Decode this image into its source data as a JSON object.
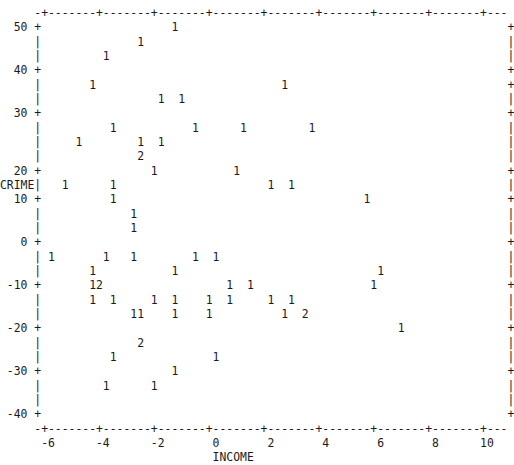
{
  "chart_data": {
    "type": "scatter",
    "title": "",
    "xlabel": "INCOME",
    "ylabel": "CRIME",
    "xlim": [
      -6.6,
      10.9
    ],
    "ylim": [
      -42,
      52
    ],
    "xticks": [
      -6,
      -4,
      -2,
      0,
      2,
      4,
      6,
      8,
      10
    ],
    "xticklabels": [
      "-6",
      "-4",
      "-2",
      "0",
      "2",
      "4",
      "6",
      "8",
      "10"
    ],
    "yticks": [
      50,
      40,
      30,
      20,
      10,
      0,
      -10,
      -20,
      -30,
      -40
    ],
    "yticklabels": [
      "50",
      "40",
      "30",
      "20",
      "10",
      "0",
      "-10",
      "-20",
      "-30",
      "-40"
    ],
    "grid": false,
    "legend": null,
    "marker_style": "count-digit",
    "marker_note": "Each plotted glyph is the count of observations falling in that character cell; '1' = one point, '2' = two points.",
    "border": "dashed-plus-axis-box",
    "points": [
      {
        "x": -1.0,
        "y": 50.7,
        "count": 1
      },
      {
        "x": -2.0,
        "y": 47.8,
        "count": 1
      },
      {
        "x": -3.3,
        "y": 45.0,
        "count": 1
      },
      {
        "x": -4.3,
        "y": 41.0,
        "count": 1
      },
      {
        "x": 1.3,
        "y": 41.0,
        "count": 1
      },
      {
        "x": -1.2,
        "y": 38.1,
        "count": 1
      },
      {
        "x": -0.5,
        "y": 38.1,
        "count": 1
      },
      {
        "x": -1.8,
        "y": 32.5,
        "count": 1
      },
      {
        "x": -0.4,
        "y": 32.5,
        "count": 1
      },
      {
        "x": -3.7,
        "y": 29.6,
        "count": 1
      },
      {
        "x": 1.6,
        "y": 29.6,
        "count": 1
      },
      {
        "x": 3.2,
        "y": 29.6,
        "count": 1
      },
      {
        "x": -3.1,
        "y": 26.7,
        "count": 1
      },
      {
        "x": -1.6,
        "y": 26.7,
        "count": 1
      },
      {
        "x": -0.9,
        "y": 26.7,
        "count": 1
      },
      {
        "x": -1.2,
        "y": 23.8,
        "count": 2
      },
      {
        "x": -1.6,
        "y": 19.0,
        "count": 1
      },
      {
        "x": 1.5,
        "y": 19.0,
        "count": 1
      },
      {
        "x": -3.5,
        "y": 16.1,
        "count": 1
      },
      {
        "x": -1.6,
        "y": 16.1,
        "count": 1
      },
      {
        "x": 3.5,
        "y": 16.1,
        "count": 1
      },
      {
        "x": 4.2,
        "y": 16.1,
        "count": 1
      },
      {
        "x": -4.8,
        "y": 13.2,
        "count": 1
      },
      {
        "x": -3.5,
        "y": 13.2,
        "count": 1
      },
      {
        "x": 6.6,
        "y": 13.2,
        "count": 1
      },
      {
        "x": -3.0,
        "y": 9.0,
        "count": 1
      },
      {
        "x": -3.0,
        "y": 6.1,
        "count": 1
      },
      {
        "x": -5.4,
        "y": 1.5,
        "count": 1
      },
      {
        "x": -3.4,
        "y": 1.5,
        "count": 1
      },
      {
        "x": -2.6,
        "y": 1.5,
        "count": 1
      },
      {
        "x": -0.8,
        "y": 1.5,
        "count": 1
      },
      {
        "x": 0.0,
        "y": 1.5,
        "count": 1
      },
      {
        "x": -3.6,
        "y": -1.4,
        "count": 1
      },
      {
        "x": -0.9,
        "y": -1.4,
        "count": 1
      },
      {
        "x": 6.2,
        "y": -1.4,
        "count": 1
      },
      {
        "x": -3.6,
        "y": -5.6,
        "count": 1
      },
      {
        "x": -3.1,
        "y": -5.6,
        "count": 2
      },
      {
        "x": 1.0,
        "y": -5.6,
        "count": 1
      },
      {
        "x": 1.8,
        "y": -5.6,
        "count": 1
      },
      {
        "x": 6.4,
        "y": -5.6,
        "count": 1
      },
      {
        "x": -3.6,
        "y": -8.5,
        "count": 1
      },
      {
        "x": -2.9,
        "y": -8.5,
        "count": 1
      },
      {
        "x": -1.4,
        "y": -8.5,
        "count": 1
      },
      {
        "x": -0.8,
        "y": -8.5,
        "count": 1
      },
      {
        "x": 0.3,
        "y": -8.5,
        "count": 1
      },
      {
        "x": 1.0,
        "y": -8.5,
        "count": 1
      },
      {
        "x": 2.4,
        "y": -8.5,
        "count": 1
      },
      {
        "x": 3.0,
        "y": -8.5,
        "count": 1
      },
      {
        "x": -1.4,
        "y": -11.4,
        "count": 1
      },
      {
        "x": -1.1,
        "y": -11.4,
        "count": 1
      },
      {
        "x": 0.3,
        "y": -11.4,
        "count": 1
      },
      {
        "x": 1.0,
        "y": -11.4,
        "count": 1
      },
      {
        "x": 3.4,
        "y": -11.4,
        "count": 1
      },
      {
        "x": 4.0,
        "y": -11.4,
        "count": 2
      },
      {
        "x": 8.9,
        "y": -15.6,
        "count": 1
      },
      {
        "x": 0.6,
        "y": -18.5,
        "count": 2
      },
      {
        "x": -1.6,
        "y": -21.4,
        "count": 1
      },
      {
        "x": 2.7,
        "y": -21.4,
        "count": 1
      },
      {
        "x": 1.2,
        "y": -25.6,
        "count": 1
      },
      {
        "x": -2.1,
        "y": -28.5,
        "count": 1
      },
      {
        "x": -0.1,
        "y": -28.5,
        "count": 1
      }
    ],
    "n_glyphs": 61,
    "n_observations": 65
  },
  "plot": {
    "ascii": [
      "     -+-------+-------+-------+-------+-------+-------+-------+-------+---",
      "  50 +                   1                                                +",
      "     |              1                                                     |",
      "     |         1                                                          |",
      "  40 +                                                                    +",
      "     |       1                           1                                +",
      "     |                 1  1                                               |",
      "  30 +                                                                    +",
      "     |          1           1      1         1                            |",
      "     |     1        1  1                                                  |",
      "     |              2                                                     |",
      "  20 +                1           1                                       +",
      "CRIME|   1      1                      1  1                               |",
      "  10 +          1                                    1                    +",
      "     |             1                                                      |",
      "     |             1                                                      |",
      "   0 +                                                                    +",
      "     | 1       1   1        1  1                                          |",
      "     |       1           1                             1                  |",
      " -10 +       12                  1  1                 1                   +",
      "     |       1  1     1  1    1  1     1  1                               |",
      "     |             11    1    1          1  2                             |",
      " -20 +                                                    1               +",
      "     |              2                                                     |",
      "     |          1              1                                          |",
      " -30 +                   1                                                +",
      "     |         1      1                                                   |",
      "     |                                                                    |",
      " -40 +                                                                    +",
      "     -+-------+-------+-------+-------+-------+-------+-------+-------+---",
      "      -6      -4      -2       0       2       4       6       8      10  ",
      "                               INCOME                                    "
    ]
  },
  "labels": {
    "ylabel": "CRIME",
    "xlabel": "INCOME"
  }
}
